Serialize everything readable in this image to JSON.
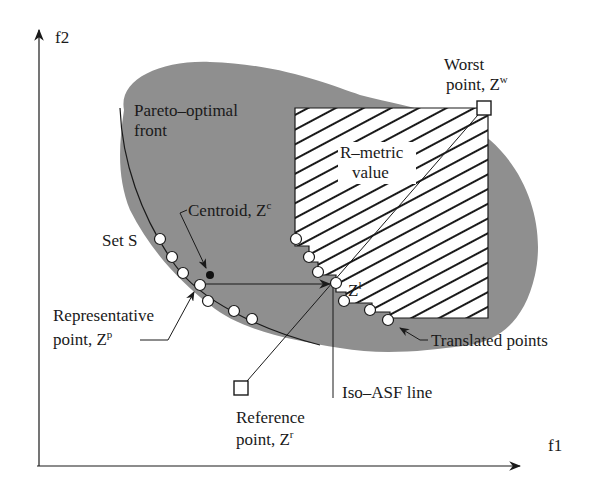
{
  "axes": {
    "x_label": "f1",
    "y_label": "f2"
  },
  "labels": {
    "pareto_front": [
      "Pareto–optimal",
      "front"
    ],
    "worst_point": [
      "Worst",
      "point, Z",
      "w"
    ],
    "r_metric": [
      "R–metric",
      "value"
    ],
    "centroid": [
      "Centroid, Z",
      "c"
    ],
    "set_s": "Set S",
    "zl": [
      "Z",
      "l"
    ],
    "representative": [
      "Representative",
      "point, Z",
      "p"
    ],
    "translated": "Translated points",
    "iso_asf": "Iso–ASF line",
    "reference": [
      "Reference",
      "point, Z",
      "r"
    ]
  },
  "colors": {
    "region_fill": "#8f8f8f",
    "line": "#1a1a1a",
    "point_fill": "#ffffff",
    "background": "#ffffff"
  },
  "points": {
    "set_s": [
      [
        160,
        239
      ],
      [
        172,
        257
      ],
      [
        183,
        273
      ],
      [
        200,
        285
      ],
      [
        208,
        301
      ],
      [
        234,
        311
      ],
      [
        252,
        319
      ]
    ],
    "translated": [
      [
        296,
        239
      ],
      [
        309,
        257
      ],
      [
        318,
        272
      ],
      [
        336,
        283
      ],
      [
        344,
        301
      ],
      [
        370,
        310
      ],
      [
        388,
        320
      ]
    ],
    "centroid": [
      210,
      275
    ],
    "representative": [
      200,
      285
    ],
    "zl": [
      336,
      283
    ],
    "worst": [
      484,
      108
    ],
    "reference": [
      241,
      388
    ]
  }
}
